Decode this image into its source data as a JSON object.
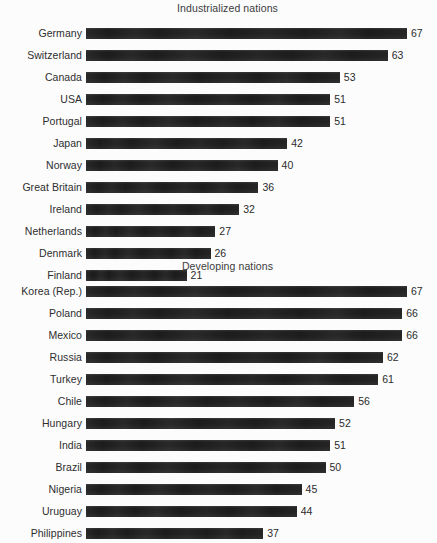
{
  "chart_data": {
    "type": "bar",
    "orientation": "horizontal",
    "title": "",
    "xlabel": "",
    "ylabel": "",
    "xlim": [
      0,
      67
    ],
    "grid": false,
    "legend": false,
    "value_labels": true,
    "panels": [
      {
        "title": "Industrialized nations",
        "categories": [
          "Germany",
          "Switzerland",
          "Canada",
          "USA",
          "Portugal",
          "Japan",
          "Norway",
          "Great Britain",
          "Ireland",
          "Netherlands",
          "Denmark",
          "Finland"
        ],
        "values": [
          67,
          63,
          53,
          51,
          51,
          42,
          40,
          36,
          32,
          27,
          26,
          21
        ]
      },
      {
        "title": "Developing nations",
        "categories": [
          "Korea (Rep.)",
          "Poland",
          "Mexico",
          "Russia",
          "Turkey",
          "Chile",
          "Hungary",
          "India",
          "Brazil",
          "Nigeria",
          "Uruguay",
          "Philippines"
        ],
        "values": [
          67,
          66,
          66,
          62,
          61,
          56,
          52,
          51,
          50,
          45,
          44,
          37
        ]
      }
    ]
  },
  "style": {
    "bar_color": "#1c1c1c",
    "background_color": "#fcfcfd",
    "text_color": "#2e2e2e"
  }
}
